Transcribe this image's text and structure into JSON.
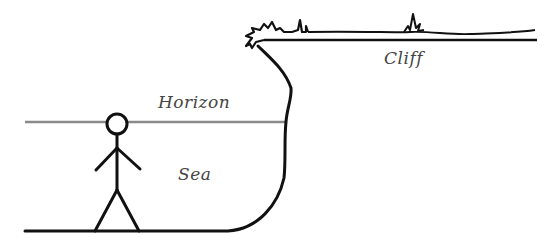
{
  "diagram": {
    "labels": {
      "cliff": "Cliff",
      "horizon": "Horizon",
      "sea": "Sea"
    },
    "colors": {
      "ink": "#111111",
      "horizon_line": "#8a8a8a",
      "text": "#444444"
    },
    "elements": [
      "cliff",
      "horizon-line",
      "sea",
      "stick-figure",
      "ground-line",
      "grass-tufts"
    ]
  }
}
